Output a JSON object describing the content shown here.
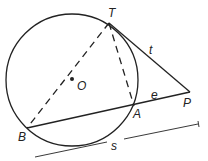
{
  "diagram": {
    "colors": {
      "stroke": "#222222",
      "background": "#ffffff"
    },
    "circle": {
      "center_label": "O",
      "cx": 72,
      "cy": 80,
      "r": 66
    },
    "points": {
      "T": {
        "label": "T",
        "x": 109,
        "y": 23
      },
      "B": {
        "label": "B",
        "x": 27,
        "y": 128
      },
      "A": {
        "label": "A",
        "x": 134,
        "y": 106
      },
      "P": {
        "label": "P",
        "x": 190,
        "y": 92
      },
      "O": {
        "label": "O",
        "x": 72,
        "y": 79
      }
    },
    "segments": {
      "tangent": {
        "label": "t",
        "from": "T",
        "to": "P",
        "style": "solid"
      },
      "external": {
        "label": "e",
        "from": "A",
        "to": "P",
        "style": "solid"
      },
      "secant": {
        "label": "s",
        "from": "B",
        "to": "P",
        "style": "dimension"
      },
      "TB": {
        "from": "T",
        "to": "B",
        "style": "dashed"
      },
      "TA": {
        "from": "T",
        "to": "A",
        "style": "dashed"
      }
    }
  }
}
